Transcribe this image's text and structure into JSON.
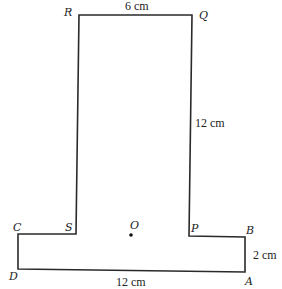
{
  "diagram": {
    "type": "composite-shape",
    "stroke_color": "#2a2a2a",
    "vertices": {
      "R": {
        "label": "R",
        "x": 79,
        "y": 15
      },
      "Q": {
        "label": "Q",
        "x": 192,
        "y": 15
      },
      "P": {
        "label": "P",
        "x": 189,
        "y": 236
      },
      "B": {
        "label": "B",
        "x": 245,
        "y": 237
      },
      "A": {
        "label": "A",
        "x": 245,
        "y": 272
      },
      "D": {
        "label": "D",
        "x": 18,
        "y": 269
      },
      "C": {
        "label": "C",
        "x": 18,
        "y": 234
      },
      "S": {
        "label": "S",
        "x": 76,
        "y": 234
      }
    },
    "center_point": {
      "label": "O",
      "x": 131,
      "y": 235
    },
    "dimensions": {
      "top": "6 cm",
      "right_tall": "12 cm",
      "right_short": "2 cm",
      "bottom": "12 cm"
    }
  }
}
